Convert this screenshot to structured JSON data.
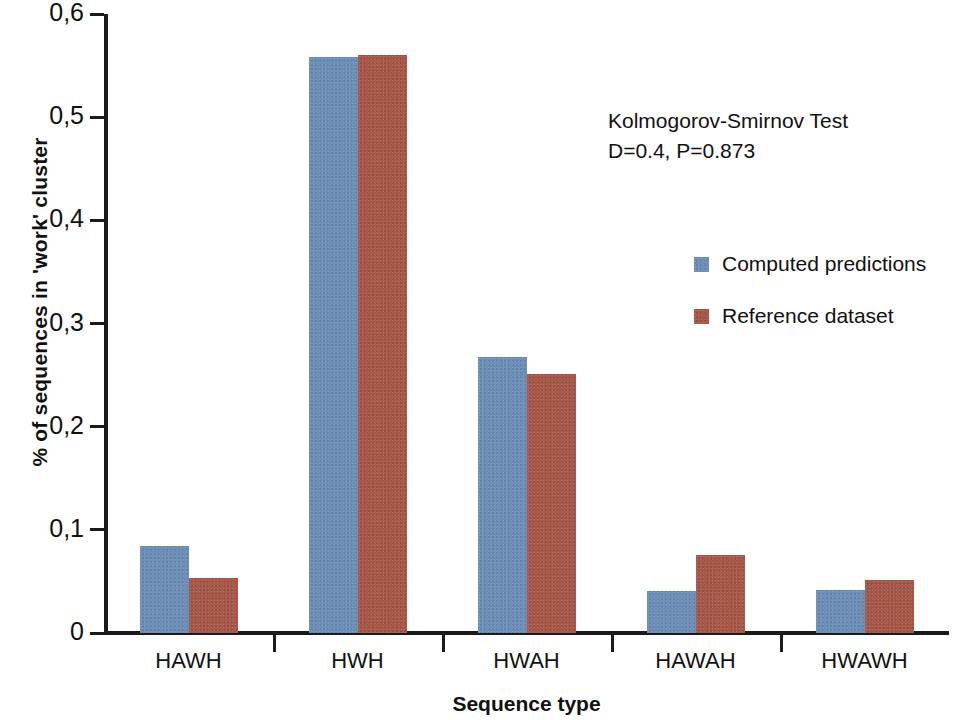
{
  "chart_data": {
    "type": "bar",
    "title": "",
    "xlabel": "Sequence type",
    "ylabel": "% of sequences in 'work' cluster",
    "categories": [
      "HAWH",
      "HWH",
      "HWAH",
      "HAWAH",
      "HWAWH"
    ],
    "series": [
      {
        "name": "Computed predictions",
        "color": "#6d8fb8",
        "values": [
          0.084,
          0.558,
          0.268,
          0.041,
          0.042
        ]
      },
      {
        "name": "Reference dataset",
        "color": "#a9594a",
        "values": [
          0.053,
          0.56,
          0.251,
          0.076,
          0.051
        ]
      }
    ],
    "ylim": [
      0,
      0.6
    ],
    "ytick_values": [
      0,
      0.1,
      0.2,
      0.3,
      0.4,
      0.5,
      0.6
    ],
    "ytick_labels": [
      "0",
      "0,1",
      "0,2",
      "0,3",
      "0,4",
      "0,5",
      "0,6"
    ],
    "grid": false,
    "legend_position": "inside-right"
  },
  "annotation": {
    "line1": "Kolmogorov-Smirnov Test",
    "line2": "D=0.4, P=0.873"
  },
  "legend": {
    "entries": [
      {
        "label": "Computed predictions",
        "color": "#6d8fb8"
      },
      {
        "label": "Reference dataset",
        "color": "#a9594a"
      }
    ]
  }
}
